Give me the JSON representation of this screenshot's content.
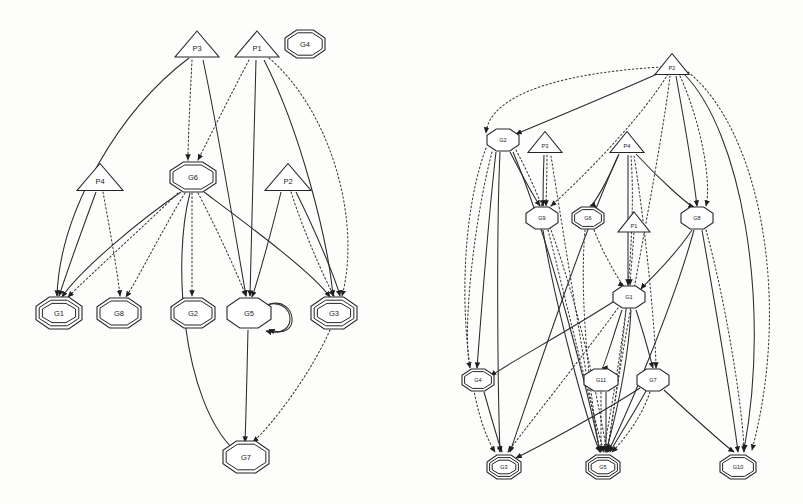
{
  "figure": {
    "kind": "goal-plan-graph-pair",
    "background_color": "#fdfdfc",
    "ink_color": "#262626",
    "panels": [
      {
        "id": "left-graph",
        "name": "left-goal-plan-graph",
        "nodes": [
          {
            "id": "L_P3",
            "label": "P3",
            "shape": "triangle",
            "border": "single",
            "x": 197,
            "y": 44,
            "w": 44,
            "h": 26,
            "font": 7.5
          },
          {
            "id": "L_P1",
            "label": "P1",
            "shape": "triangle",
            "border": "single",
            "x": 257,
            "y": 44,
            "w": 44,
            "h": 26,
            "font": 7.5
          },
          {
            "id": "L_G4",
            "label": "G4",
            "shape": "octagon",
            "border": "double",
            "x": 305,
            "y": 44,
            "w": 40,
            "h": 28,
            "font": 7.5
          },
          {
            "id": "L_P4",
            "label": "P4",
            "shape": "triangle",
            "border": "single",
            "x": 100,
            "y": 177,
            "w": 46,
            "h": 27,
            "font": 7.5
          },
          {
            "id": "L_G6",
            "label": "G6",
            "shape": "octagon",
            "border": "double",
            "x": 193,
            "y": 177,
            "w": 46,
            "h": 30,
            "font": 7.5
          },
          {
            "id": "L_P2",
            "label": "P2",
            "shape": "triangle",
            "border": "single",
            "x": 288,
            "y": 177,
            "w": 46,
            "h": 27,
            "font": 7.5
          },
          {
            "id": "L_G1",
            "label": "G1",
            "shape": "octagon",
            "border": "triple",
            "x": 59,
            "y": 313,
            "w": 46,
            "h": 32,
            "font": 7.5
          },
          {
            "id": "L_G8",
            "label": "G8",
            "shape": "octagon",
            "border": "double",
            "x": 119,
            "y": 313,
            "w": 44,
            "h": 30,
            "font": 7.5
          },
          {
            "id": "L_G2",
            "label": "G2",
            "shape": "octagon",
            "border": "double",
            "x": 193,
            "y": 313,
            "w": 44,
            "h": 30,
            "font": 7.5
          },
          {
            "id": "L_G5",
            "label": "G5",
            "shape": "octagon",
            "border": "single",
            "x": 249,
            "y": 313,
            "w": 44,
            "h": 30,
            "font": 7.5
          },
          {
            "id": "L_G3",
            "label": "G3",
            "shape": "octagon",
            "border": "triple",
            "x": 334,
            "y": 313,
            "w": 46,
            "h": 32,
            "font": 7.5
          },
          {
            "id": "L_G7",
            "label": "G7",
            "shape": "octagon",
            "border": "double",
            "x": 246,
            "y": 457,
            "w": 46,
            "h": 32,
            "font": 7.5
          }
        ],
        "edge_styles": {
          "solid": "solid",
          "dotted": "dotted"
        },
        "edges": [
          {
            "from": "L_P3",
            "to": "L_G1",
            "style": "solid",
            "path": "M 189 58 C 120 110 60 210 57 296"
          },
          {
            "from": "L_P3",
            "to": "L_G6",
            "style": "dotted",
            "path": "M 192 60 C 190 100 188 140 188 160"
          },
          {
            "from": "L_P3",
            "to": "L_G5",
            "style": "solid",
            "path": "M 203 60 C 218 130 238 250 246 296"
          },
          {
            "from": "L_P1",
            "to": "L_G6",
            "style": "dotted",
            "path": "M 249 60 C 228 100 208 140 198 160"
          },
          {
            "from": "L_P1",
            "to": "L_G5",
            "style": "solid",
            "path": "M 256 60 C 254 140 251 250 250 296"
          },
          {
            "from": "L_P1",
            "to": "L_G3",
            "style": "solid",
            "path": "M 264 60 C 300 130 328 240 333 296"
          },
          {
            "from": "L_P1",
            "to": "L_G3",
            "style": "dotted",
            "path": "M 269 58 C 330 110 362 220 342 296"
          },
          {
            "from": "L_P4",
            "to": "L_G1",
            "style": "solid",
            "path": "M 96 192 C 82 230 66 275 59 296"
          },
          {
            "from": "L_P4",
            "to": "L_G8",
            "style": "dotted",
            "path": "M 103 192 C 110 230 118 275 120 296"
          },
          {
            "from": "L_G6",
            "to": "L_G1",
            "style": "solid",
            "path": "M 181 192 C 140 220 80 270 62 297"
          },
          {
            "from": "L_G6",
            "to": "L_G1",
            "style": "dotted",
            "path": "M 178 193 C 145 225 90 275 68 297"
          },
          {
            "from": "L_G6",
            "to": "L_G8",
            "style": "dotted",
            "path": "M 185 193 C 165 225 140 275 126 297"
          },
          {
            "from": "L_G6",
            "to": "L_G2",
            "style": "dotted",
            "path": "M 192 193 C 192 225 192 275 192 296"
          },
          {
            "from": "L_G6",
            "to": "L_G5",
            "style": "dotted",
            "path": "M 198 193 C 215 225 238 275 246 296"
          },
          {
            "from": "L_G6",
            "to": "L_G3",
            "style": "solid",
            "path": "M 204 192 C 248 225 312 272 330 297"
          },
          {
            "from": "L_G6",
            "to": "L_G7",
            "style": "solid",
            "path": "M 190 193 C 172 260 182 400 234 450"
          },
          {
            "from": "L_P2",
            "to": "L_G5",
            "style": "solid",
            "path": "M 281 192 C 272 230 258 280 252 297"
          },
          {
            "from": "L_P2",
            "to": "L_G3",
            "style": "dotted",
            "path": "M 291 192 C 303 230 325 280 334 296"
          },
          {
            "from": "L_P2",
            "to": "L_G3",
            "style": "solid",
            "path": "M 296 192 C 315 230 336 280 340 296"
          },
          {
            "from": "L_G5",
            "to": "L_G7",
            "style": "solid",
            "path": "M 248 330 C 247 370 246 420 245 442"
          },
          {
            "from": "L_G5",
            "to": "L_G5",
            "style": "solid",
            "path": "M 266 305 C 296 296 300 340 266 331"
          },
          {
            "from": "L_G3",
            "to": "L_G7",
            "style": "dotted",
            "path": "M 330 330 C 310 375 272 425 253 442"
          }
        ],
        "self_loops": [
          {
            "node": "L_G5"
          }
        ]
      },
      {
        "id": "right-graph",
        "name": "right-goal-plan-graph",
        "nodes": [
          {
            "id": "R_P2",
            "label": "P2",
            "shape": "triangle",
            "border": "single",
            "x": 672,
            "y": 64,
            "w": 34,
            "h": 21,
            "font": 5.6
          },
          {
            "id": "R_G2",
            "label": "G2",
            "shape": "octagon",
            "border": "single",
            "x": 503,
            "y": 140,
            "w": 32,
            "h": 22,
            "font": 5.6
          },
          {
            "id": "R_P3",
            "label": "P3",
            "shape": "triangle",
            "border": "single",
            "x": 545,
            "y": 142,
            "w": 34,
            "h": 21,
            "font": 5.6
          },
          {
            "id": "R_P4",
            "label": "P4",
            "shape": "triangle",
            "border": "single",
            "x": 627,
            "y": 142,
            "w": 34,
            "h": 21,
            "font": 5.6
          },
          {
            "id": "R_G9",
            "label": "G9",
            "shape": "octagon",
            "border": "single",
            "x": 542,
            "y": 218,
            "w": 32,
            "h": 22,
            "font": 5.6
          },
          {
            "id": "R_G6",
            "label": "G6",
            "shape": "octagon",
            "border": "double",
            "x": 588,
            "y": 218,
            "w": 32,
            "h": 22,
            "font": 5.6
          },
          {
            "id": "R_P1",
            "label": "P1",
            "shape": "triangle",
            "border": "single",
            "x": 634,
            "y": 222,
            "w": 32,
            "h": 20,
            "font": 5.6
          },
          {
            "id": "R_G8",
            "label": "G8",
            "shape": "octagon",
            "border": "single",
            "x": 697,
            "y": 218,
            "w": 32,
            "h": 22,
            "font": 5.6
          },
          {
            "id": "R_G1",
            "label": "G1",
            "shape": "octagon",
            "border": "single",
            "x": 629,
            "y": 297,
            "w": 32,
            "h": 22,
            "font": 5.6
          },
          {
            "id": "R_G4",
            "label": "G4",
            "shape": "octagon",
            "border": "double",
            "x": 478,
            "y": 380,
            "w": 32,
            "h": 22,
            "font": 5.6
          },
          {
            "id": "R_G11",
            "label": "G11",
            "shape": "octagon",
            "border": "single",
            "x": 601,
            "y": 380,
            "w": 34,
            "h": 22,
            "font": 5.6
          },
          {
            "id": "R_G7",
            "label": "G7",
            "shape": "octagon",
            "border": "single",
            "x": 653,
            "y": 380,
            "w": 32,
            "h": 22,
            "font": 5.6
          },
          {
            "id": "R_G3",
            "label": "G3",
            "shape": "octagon",
            "border": "triple",
            "x": 504,
            "y": 467,
            "w": 34,
            "h": 24,
            "font": 5.6
          },
          {
            "id": "R_G5",
            "label": "G5",
            "shape": "octagon",
            "border": "triple",
            "x": 603,
            "y": 467,
            "w": 34,
            "h": 24,
            "font": 5.6
          },
          {
            "id": "R_G10",
            "label": "G10",
            "shape": "octagon",
            "border": "double",
            "x": 738,
            "y": 467,
            "w": 36,
            "h": 24,
            "font": 5.6
          }
        ],
        "edges": [
          {
            "from": "R_P2",
            "to": "R_G2",
            "style": "solid",
            "path": "M 664 71 C 610 95 545 122 516 134"
          },
          {
            "from": "R_P2",
            "to": "R_G2",
            "style": "dotted",
            "path": "M 662 67 C 570 72 490 92 486 133"
          },
          {
            "from": "R_P2",
            "to": "R_G9",
            "style": "dotted",
            "path": "M 668 74 C 640 120 580 180 551 206"
          },
          {
            "from": "R_P2",
            "to": "R_G8",
            "style": "solid",
            "path": "M 676 76 C 684 120 694 180 697 206"
          },
          {
            "from": "R_P2",
            "to": "R_G8",
            "style": "dotted",
            "path": "M 680 76 C 700 120 712 180 706 206"
          },
          {
            "from": "R_P2",
            "to": "R_G10",
            "style": "solid",
            "path": "M 684 74 C 740 130 772 300 744 450"
          },
          {
            "from": "R_P2",
            "to": "R_G10",
            "style": "dotted",
            "path": "M 688 72 C 760 130 792 300 752 450"
          },
          {
            "from": "R_P2",
            "to": "R_G5",
            "style": "dotted",
            "path": "M 670 76 C 660 160 622 340 608 450"
          },
          {
            "from": "R_G2",
            "to": "R_G4",
            "style": "solid",
            "path": "M 496 152 C 488 220 480 330 477 368"
          },
          {
            "from": "R_G2",
            "to": "R_G4",
            "style": "dotted",
            "path": "M 492 152 C 474 220 462 330 470 368"
          },
          {
            "from": "R_G2",
            "to": "R_G3",
            "style": "solid",
            "path": "M 500 152 C 496 240 498 400 500 452"
          },
          {
            "from": "R_G2",
            "to": "R_G3",
            "style": "dotted",
            "path": "M 486 148 C 452 240 462 400 495 452"
          },
          {
            "from": "R_G2",
            "to": "R_G9",
            "style": "solid",
            "path": "M 510 152 C 522 175 536 200 540 206"
          },
          {
            "from": "R_G2",
            "to": "R_G5",
            "style": "solid",
            "path": "M 513 152 C 550 240 590 400 600 452"
          },
          {
            "from": "R_G2",
            "to": "R_G5",
            "style": "dotted",
            "path": "M 516 150 C 570 250 598 400 607 452"
          },
          {
            "from": "R_P3",
            "to": "R_G9",
            "style": "solid",
            "path": "M 544 155 C 543 180 543 200 543 206"
          },
          {
            "from": "R_P3",
            "to": "R_G9",
            "style": "dotted",
            "path": "M 547 155 C 547 180 546 200 546 206"
          },
          {
            "from": "R_P3",
            "to": "R_G5",
            "style": "dotted",
            "path": "M 551 156 C 566 250 590 400 600 452"
          },
          {
            "from": "R_P4",
            "to": "R_G6",
            "style": "solid",
            "path": "M 619 154 C 608 180 594 205 590 206"
          },
          {
            "from": "R_P4",
            "to": "R_G1",
            "style": "solid",
            "path": "M 628 155 C 628 220 628 270 628 285"
          },
          {
            "from": "R_P4",
            "to": "R_G8",
            "style": "solid",
            "path": "M 636 154 C 660 180 688 205 694 207"
          },
          {
            "from": "R_P4",
            "to": "R_G7",
            "style": "dotted",
            "path": "M 634 156 C 646 230 656 340 656 368"
          },
          {
            "from": "R_P4",
            "to": "R_G3",
            "style": "solid",
            "path": "M 618 156 C 580 240 528 400 510 452"
          },
          {
            "from": "R_P4",
            "to": "R_G5",
            "style": "dotted",
            "path": "M 631 156 C 638 250 616 400 607 452"
          },
          {
            "from": "R_G9",
            "to": "R_G5",
            "style": "solid",
            "path": "M 543 230 C 554 300 586 420 600 452"
          },
          {
            "from": "R_G9",
            "to": "R_G5",
            "style": "dotted",
            "path": "M 548 230 C 566 300 594 420 604 452"
          },
          {
            "from": "R_G6",
            "to": "R_G1",
            "style": "dotted",
            "path": "M 594 230 C 606 260 622 285 624 286"
          },
          {
            "from": "R_G6",
            "to": "R_G5",
            "style": "dotted",
            "path": "M 585 230 C 578 310 594 420 600 452"
          },
          {
            "from": "R_P1",
            "to": "R_G1",
            "style": "dotted",
            "path": "M 634 233 C 632 260 630 282 630 285"
          },
          {
            "from": "R_G8",
            "to": "R_G1",
            "style": "solid",
            "path": "M 692 230 C 672 260 644 285 641 289"
          },
          {
            "from": "R_G8",
            "to": "R_G5",
            "style": "solid",
            "path": "M 694 230 C 672 310 624 420 608 452"
          },
          {
            "from": "R_G8",
            "to": "R_G10",
            "style": "solid",
            "path": "M 702 230 C 716 310 734 420 738 452"
          },
          {
            "from": "R_G8",
            "to": "R_G10",
            "style": "dotted",
            "path": "M 706 230 C 728 310 744 420 744 452"
          },
          {
            "from": "R_G1",
            "to": "R_G4",
            "style": "solid",
            "path": "M 616 300 C 570 330 500 368 491 376"
          },
          {
            "from": "R_G1",
            "to": "R_G11",
            "style": "solid",
            "path": "M 622 310 C 612 340 604 368 602 368"
          },
          {
            "from": "R_G1",
            "to": "R_G7",
            "style": "solid",
            "path": "M 636 310 C 646 340 652 365 653 368"
          },
          {
            "from": "R_G1",
            "to": "R_G5",
            "style": "dotted",
            "path": "M 626 310 C 618 370 608 430 603 452"
          },
          {
            "from": "R_G1",
            "to": "R_G5",
            "style": "solid",
            "path": "M 631 310 C 628 370 612 430 606 452"
          },
          {
            "from": "R_G1",
            "to": "R_G3",
            "style": "dotted",
            "path": "M 618 308 C 580 360 524 430 508 452"
          },
          {
            "from": "R_G11",
            "to": "R_G5",
            "style": "dotted",
            "path": "M 601 392 C 601 420 601 442 601 452"
          },
          {
            "from": "R_G11",
            "to": "R_G5",
            "style": "solid",
            "path": "M 606 392 C 606 420 606 442 606 452"
          },
          {
            "from": "R_G7",
            "to": "R_G5",
            "style": "solid",
            "path": "M 646 391 C 630 420 614 444 610 452"
          },
          {
            "from": "R_G7",
            "to": "R_G5",
            "style": "dotted",
            "path": "M 650 392 C 640 422 618 446 612 452"
          },
          {
            "from": "R_G7",
            "to": "R_G3",
            "style": "solid",
            "path": "M 640 388 C 594 418 528 452 516 458"
          },
          {
            "from": "R_G7",
            "to": "R_G10",
            "style": "solid",
            "path": "M 664 390 C 694 418 728 448 734 452"
          },
          {
            "from": "R_G4",
            "to": "R_G3",
            "style": "solid",
            "path": "M 484 392 C 492 420 500 448 502 452"
          }
        ]
      }
    ]
  }
}
